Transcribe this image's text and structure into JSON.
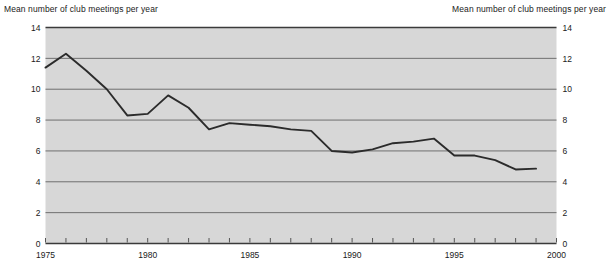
{
  "chart_data": {
    "type": "line",
    "title": "",
    "xlabel": "",
    "ylabel": "Mean number of club meetings per year",
    "ylabel_left": "Mean number of club meetings per year",
    "ylabel_right": "Mean number of club meetings per year",
    "xlim": [
      1975,
      2000
    ],
    "ylim": [
      0,
      14
    ],
    "grid": true,
    "legend": "none",
    "x_tick_labels": [
      "1975",
      "1980",
      "1985",
      "1990",
      "1995",
      "2000"
    ],
    "x_tick_values": [
      1975,
      1980,
      1985,
      1990,
      1995,
      2000
    ],
    "x_minor_tick_values": [
      1975,
      1976,
      1977,
      1978,
      1979,
      1980,
      1981,
      1982,
      1983,
      1984,
      1985,
      1986,
      1987,
      1988,
      1989,
      1990,
      1991,
      1992,
      1993,
      1994,
      1995,
      1996,
      1997,
      1998,
      1999,
      2000
    ],
    "y_tick_labels_left": [
      "0",
      "2",
      "4",
      "6",
      "8",
      "10",
      "12",
      "14"
    ],
    "y_tick_labels_right": [
      "0",
      "2",
      "4",
      "6",
      "8",
      "10",
      "12",
      "14"
    ],
    "y_tick_values": [
      0,
      2,
      4,
      6,
      8,
      10,
      12,
      14
    ],
    "x": [
      1975,
      1976,
      1977,
      1978,
      1979,
      1980,
      1981,
      1982,
      1983,
      1984,
      1985,
      1986,
      1987,
      1988,
      1989,
      1990,
      1991,
      1992,
      1993,
      1994,
      1995,
      1996,
      1997,
      1998,
      1999
    ],
    "values": [
      11.4,
      12.3,
      11.2,
      10.0,
      8.3,
      8.4,
      9.6,
      8.8,
      7.4,
      7.8,
      7.7,
      7.6,
      7.4,
      7.3,
      6.0,
      5.9,
      6.1,
      6.5,
      6.6,
      6.8,
      5.7,
      5.7,
      5.4,
      4.8,
      4.85
    ],
    "series": [
      {
        "name": "Mean number of club meetings per year",
        "values": [
          11.4,
          12.3,
          11.2,
          10.0,
          8.3,
          8.4,
          9.6,
          8.8,
          7.4,
          7.8,
          7.7,
          7.6,
          7.4,
          7.3,
          6.0,
          5.9,
          6.1,
          6.5,
          6.6,
          6.8,
          5.7,
          5.7,
          5.4,
          4.8,
          4.85
        ]
      }
    ]
  },
  "style": {
    "plot_background": "#d7d7d7",
    "gridline_color": "#6f6f6f",
    "line_color": "#2b2b2b",
    "axis_color": "#3a3a3a",
    "text_color": "#1a1a1a"
  }
}
